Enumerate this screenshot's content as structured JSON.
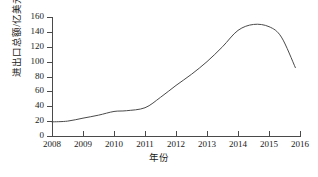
{
  "chart_data": {
    "type": "line",
    "title": "",
    "xlabel": "年份",
    "ylabel": "进出口总额/亿美元",
    "xlim": [
      2008,
      2016
    ],
    "ylim": [
      0,
      160
    ],
    "grid": false,
    "legend": false,
    "x_tick_labels": [
      "2008",
      "2009",
      "2010",
      "2011",
      "2012",
      "2013",
      "2014",
      "2015",
      "2016"
    ],
    "y_tick_labels": [
      "0",
      "20",
      "40",
      "60",
      "80",
      "100",
      "120",
      "140",
      "160"
    ],
    "y_ticks": [
      0,
      20,
      40,
      60,
      80,
      100,
      120,
      140,
      160
    ],
    "x_ticks": [
      2008,
      2009,
      2010,
      2011,
      2012,
      2013,
      2014,
      2015,
      2016
    ],
    "series": [
      {
        "name": "进出口总额",
        "color": "#4a4a4a",
        "x": [
          2008,
          2008.5,
          2009,
          2009.5,
          2010,
          2010.4,
          2011,
          2011.5,
          2012,
          2012.5,
          2013,
          2013.5,
          2014,
          2014.5,
          2015,
          2015.4,
          2015.85
        ],
        "values": [
          19,
          20,
          24,
          28,
          33,
          34,
          38,
          52,
          68,
          83,
          100,
          120,
          142,
          150,
          147,
          133,
          92
        ]
      }
    ]
  },
  "axes": {
    "y_title": "进出口总额/亿美元",
    "x_title": "年份"
  }
}
